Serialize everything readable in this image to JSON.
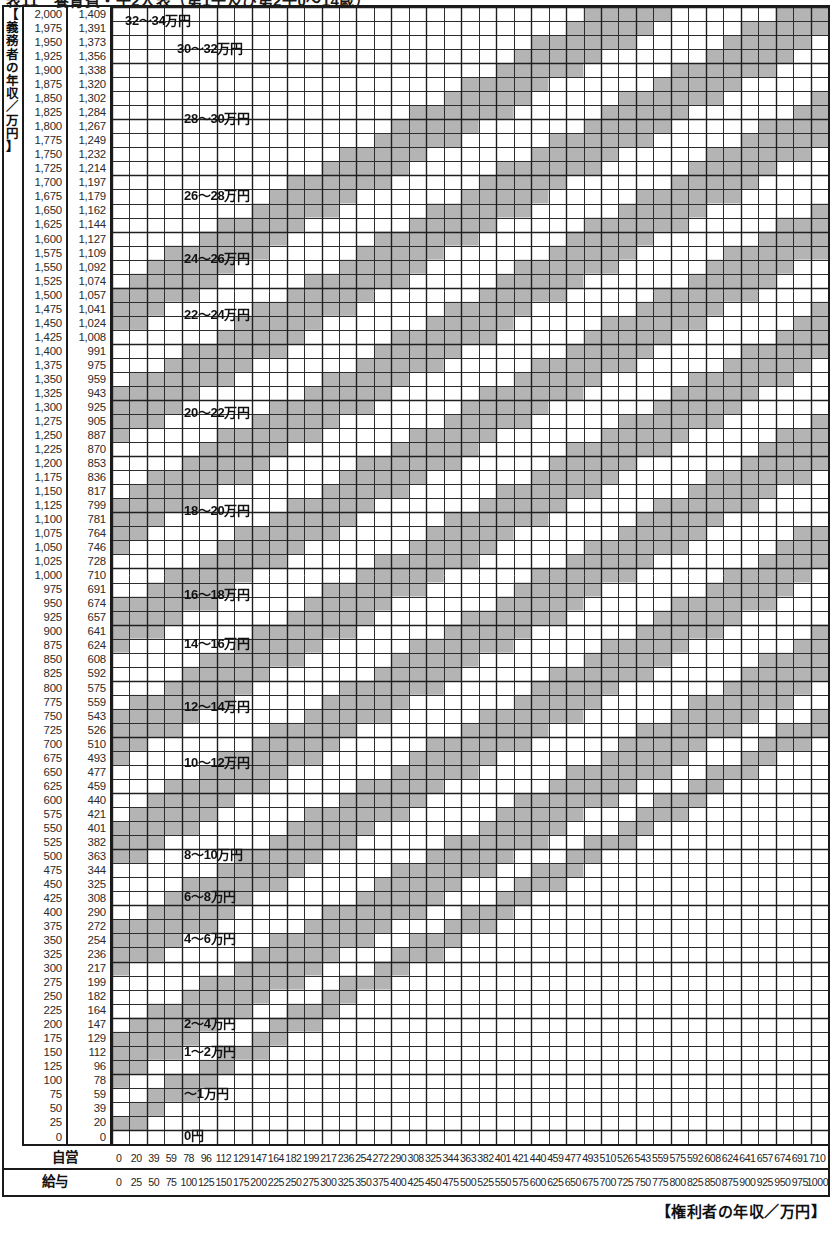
{
  "title": "表11　養育費・子2人表（第1子及び第2子0～14歳）",
  "yaxis": {
    "caption": "【義務者の年収／万円】",
    "caption_chars": [
      "【",
      "義",
      "務",
      "者",
      "の",
      "年",
      "収",
      "／",
      "万",
      "円",
      "】"
    ],
    "salary_header": "給与",
    "self_header": "自営",
    "salary": [
      2000,
      1975,
      1950,
      1925,
      1900,
      1875,
      1850,
      1825,
      1800,
      1775,
      1750,
      1725,
      1700,
      1675,
      1650,
      1625,
      1600,
      1575,
      1550,
      1525,
      1500,
      1475,
      1450,
      1425,
      1400,
      1375,
      1350,
      1325,
      1300,
      1275,
      1250,
      1225,
      1200,
      1175,
      1150,
      1125,
      1100,
      1075,
      1050,
      1025,
      1000,
      975,
      950,
      925,
      900,
      875,
      850,
      825,
      800,
      775,
      750,
      725,
      700,
      675,
      650,
      625,
      600,
      575,
      550,
      525,
      500,
      475,
      450,
      425,
      400,
      375,
      350,
      325,
      300,
      275,
      250,
      225,
      200,
      175,
      150,
      125,
      100,
      75,
      50,
      25,
      0
    ],
    "salary_labels": [
      "2,000",
      "1,975",
      "1,950",
      "1,925",
      "1,900",
      "1,875",
      "1,850",
      "1,825",
      "1,800",
      "1,775",
      "1,750",
      "1,725",
      "1,700",
      "1,675",
      "1,650",
      "1,625",
      "1,600",
      "1,575",
      "1,550",
      "1,525",
      "1,500",
      "1,475",
      "1,450",
      "1,425",
      "1,400",
      "1,375",
      "1,350",
      "1,325",
      "1,300",
      "1,275",
      "1,250",
      "1,225",
      "1,200",
      "1,175",
      "1,150",
      "1,125",
      "1,100",
      "1,075",
      "1,050",
      "1,025",
      "1,000",
      "975",
      "950",
      "925",
      "900",
      "875",
      "850",
      "825",
      "800",
      "775",
      "750",
      "725",
      "700",
      "675",
      "650",
      "625",
      "600",
      "575",
      "550",
      "525",
      "500",
      "475",
      "450",
      "425",
      "400",
      "375",
      "350",
      "325",
      "300",
      "275",
      "250",
      "225",
      "200",
      "175",
      "150",
      "125",
      "100",
      "75",
      "50",
      "25",
      "0"
    ],
    "self": [
      1409,
      1391,
      1373,
      1356,
      1338,
      1320,
      1302,
      1284,
      1267,
      1249,
      1232,
      1214,
      1197,
      1179,
      1162,
      1144,
      1127,
      1109,
      1092,
      1074,
      1057,
      1041,
      1024,
      1008,
      991,
      975,
      959,
      943,
      925,
      905,
      887,
      870,
      853,
      836,
      817,
      799,
      781,
      764,
      746,
      728,
      710,
      691,
      674,
      657,
      641,
      624,
      608,
      592,
      575,
      559,
      543,
      526,
      510,
      493,
      477,
      459,
      440,
      421,
      401,
      382,
      363,
      344,
      325,
      308,
      290,
      272,
      254,
      236,
      217,
      199,
      182,
      164,
      147,
      129,
      112,
      96,
      78,
      59,
      39,
      20,
      0
    ],
    "self_labels": [
      "1,409",
      "1,391",
      "1,373",
      "1,356",
      "1,338",
      "1,320",
      "1,302",
      "1,284",
      "1,267",
      "1,249",
      "1,232",
      "1,214",
      "1,197",
      "1,179",
      "1,162",
      "1,144",
      "1,127",
      "1,109",
      "1,092",
      "1,074",
      "1,057",
      "1,041",
      "1,024",
      "1,008",
      "991",
      "975",
      "959",
      "943",
      "925",
      "905",
      "887",
      "870",
      "853",
      "836",
      "817",
      "799",
      "781",
      "764",
      "746",
      "728",
      "710",
      "691",
      "674",
      "657",
      "641",
      "624",
      "608",
      "592",
      "575",
      "559",
      "543",
      "526",
      "510",
      "493",
      "477",
      "459",
      "440",
      "421",
      "401",
      "382",
      "363",
      "344",
      "325",
      "308",
      "290",
      "272",
      "254",
      "236",
      "217",
      "199",
      "182",
      "164",
      "147",
      "129",
      "112",
      "96",
      "78",
      "59",
      "39",
      "20",
      "0"
    ]
  },
  "xaxis": {
    "caption": "【権利者の年収／万円】",
    "self_header": "自営",
    "salary_header": "給与",
    "self": [
      0,
      20,
      39,
      59,
      78,
      96,
      112,
      129,
      147,
      164,
      182,
      199,
      217,
      236,
      254,
      272,
      290,
      308,
      325,
      344,
      363,
      382,
      401,
      421,
      440,
      459,
      477,
      493,
      510,
      526,
      543,
      559,
      575,
      592,
      608,
      624,
      641,
      657,
      674,
      691,
      710
    ],
    "salary": [
      0,
      25,
      50,
      75,
      100,
      125,
      150,
      175,
      200,
      225,
      250,
      275,
      300,
      325,
      350,
      375,
      400,
      425,
      450,
      475,
      500,
      525,
      550,
      575,
      600,
      625,
      650,
      675,
      700,
      725,
      750,
      775,
      800,
      825,
      850,
      875,
      900,
      925,
      950,
      975,
      1000
    ]
  },
  "bands": [
    {
      "label": "0円",
      "min": 0,
      "max": 0,
      "label_x": 72,
      "label_y": 1122
    },
    {
      "label": "～1万円",
      "min": 0,
      "max": 1,
      "label_x": 72,
      "label_y": 1080
    },
    {
      "label": "1～2万円",
      "min": 1,
      "max": 2,
      "label_x": 72,
      "label_y": 1038
    },
    {
      "label": "2～4万円",
      "min": 2,
      "max": 4,
      "label_x": 72,
      "label_y": 1010
    },
    {
      "label": "4～6万円",
      "min": 4,
      "max": 6,
      "label_x": 72,
      "label_y": 925
    },
    {
      "label": "6～8万円",
      "min": 6,
      "max": 8,
      "label_x": 72,
      "label_y": 883
    },
    {
      "label": "8～10万円",
      "min": 8,
      "max": 10,
      "label_x": 72,
      "label_y": 841
    },
    {
      "label": "10～12万円",
      "min": 10,
      "max": 12,
      "label_x": 72,
      "label_y": 749
    },
    {
      "label": "12～14万円",
      "min": 12,
      "max": 14,
      "label_x": 72,
      "label_y": 693
    },
    {
      "label": "14～16万円",
      "min": 14,
      "max": 16,
      "label_x": 72,
      "label_y": 630
    },
    {
      "label": "16～18万円",
      "min": 16,
      "max": 18,
      "label_x": 72,
      "label_y": 581
    },
    {
      "label": "18～20万円",
      "min": 18,
      "max": 20,
      "label_x": 72,
      "label_y": 497
    },
    {
      "label": "20～22万円",
      "min": 20,
      "max": 22,
      "label_x": 72,
      "label_y": 399
    },
    {
      "label": "22～24万円",
      "min": 22,
      "max": 24,
      "label_x": 72,
      "label_y": 301
    },
    {
      "label": "24～26万円",
      "min": 24,
      "max": 26,
      "label_x": 72,
      "label_y": 245
    },
    {
      "label": "26～28万円",
      "min": 26,
      "max": 28,
      "label_x": 72,
      "label_y": 182
    },
    {
      "label": "28～30万円",
      "min": 28,
      "max": 30,
      "label_x": 72,
      "label_y": 105
    },
    {
      "label": "30～32万円",
      "min": 30,
      "max": 32,
      "label_x": 65,
      "label_y": 35
    },
    {
      "label": "32～34万円",
      "min": 32,
      "max": 34,
      "label_x": 13,
      "label_y": 7
    }
  ],
  "chart_data": {
    "type": "heatmap",
    "title": "表11　養育費・子2人表（第1子及び第2子0～14歳）",
    "xlabel": "【権利者の年収／万円】",
    "ylabel": "【義務者の年収／万円】",
    "grid": true,
    "legend_position": "in-plot-diagonal-band-labels",
    "columns": 41,
    "rows": 81,
    "x_salary_ticks": [
      0,
      25,
      50,
      75,
      100,
      125,
      150,
      175,
      200,
      225,
      250,
      275,
      300,
      325,
      350,
      375,
      400,
      425,
      450,
      475,
      500,
      525,
      550,
      575,
      600,
      625,
      650,
      675,
      700,
      725,
      750,
      775,
      800,
      825,
      850,
      875,
      900,
      925,
      950,
      975,
      1000
    ],
    "x_self_ticks": [
      0,
      20,
      39,
      59,
      78,
      96,
      112,
      129,
      147,
      164,
      182,
      199,
      217,
      236,
      254,
      272,
      290,
      308,
      325,
      344,
      363,
      382,
      401,
      421,
      440,
      459,
      477,
      493,
      510,
      526,
      543,
      559,
      575,
      592,
      608,
      624,
      641,
      657,
      674,
      691,
      710
    ],
    "y_salary_ticks": [
      0,
      25,
      50,
      75,
      100,
      125,
      150,
      175,
      200,
      225,
      250,
      275,
      300,
      325,
      350,
      375,
      400,
      425,
      450,
      475,
      500,
      525,
      550,
      575,
      600,
      625,
      650,
      675,
      700,
      725,
      750,
      775,
      800,
      825,
      850,
      875,
      900,
      925,
      950,
      975,
      1000,
      1025,
      1050,
      1075,
      1100,
      1125,
      1150,
      1175,
      1200,
      1225,
      1250,
      1275,
      1300,
      1325,
      1350,
      1375,
      1400,
      1425,
      1450,
      1475,
      1500,
      1525,
      1550,
      1575,
      1600,
      1625,
      1650,
      1675,
      1700,
      1725,
      1750,
      1775,
      1800,
      1825,
      1850,
      1875,
      1900,
      1925,
      1950,
      1975,
      2000
    ],
    "y_self_ticks": [
      0,
      20,
      39,
      59,
      78,
      96,
      112,
      129,
      147,
      164,
      182,
      199,
      217,
      236,
      254,
      272,
      290,
      308,
      325,
      344,
      363,
      382,
      401,
      421,
      440,
      459,
      477,
      493,
      510,
      526,
      543,
      559,
      575,
      592,
      608,
      624,
      641,
      657,
      674,
      691,
      710,
      728,
      746,
      764,
      781,
      799,
      817,
      836,
      853,
      870,
      887,
      905,
      925,
      943,
      959,
      975,
      991,
      1008,
      1024,
      1041,
      1057,
      1074,
      1092,
      1109,
      1127,
      1144,
      1162,
      1179,
      1197,
      1214,
      1232,
      1249,
      1267,
      1284,
      1302,
      1320,
      1338,
      1356,
      1373,
      1391,
      1409
    ],
    "band_boundaries_man_yen": [
      0,
      1,
      2,
      4,
      6,
      8,
      10,
      12,
      14,
      16,
      18,
      20,
      22,
      24,
      26,
      28,
      30,
      32,
      34
    ],
    "band_labels": [
      "0円",
      "～1万円",
      "1～2万円",
      "2～4万円",
      "4～6万円",
      "6～8万円",
      "8～10万円",
      "10～12万円",
      "12～14万円",
      "14～16万円",
      "16～18万円",
      "18～20万円",
      "20～22万円",
      "22～24万円",
      "24～26万円",
      "26～28万円",
      "28～30万円",
      "30～32万円",
      "32～34万円"
    ],
    "shading": {
      "fill_color": "#b4b4b4",
      "blank_color": "#ffffff",
      "line_color": "#2d2d2d",
      "pattern": "alternating diagonal bands descending from upper-left to lower-right"
    }
  },
  "colors": {
    "fill": "#b4b4b4",
    "blank": "#ffffff",
    "line": "#2d2d2d",
    "frame": "#1a1a1a",
    "text": "#111111"
  }
}
